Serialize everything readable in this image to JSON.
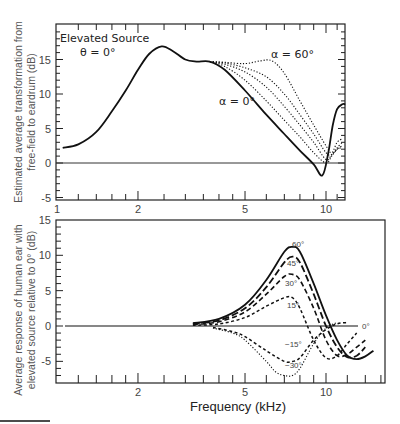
{
  "chart_data": [
    {
      "type": "line",
      "panel": "top",
      "title": "",
      "xlabel": "",
      "ylabel_line1": "Estimated average transformation from",
      "ylabel_line2": "free-field to eardrum (dB)",
      "xscale": "log",
      "xlim": [
        1,
        11.8
      ],
      "ylim": [
        -5,
        19
      ],
      "xticks": [
        {
          "value": 1,
          "label": "1"
        },
        {
          "value": 2,
          "label": "2"
        },
        {
          "value": 5,
          "label": "5"
        },
        {
          "value": 10,
          "label": "10"
        }
      ],
      "yticks": [
        {
          "value": 15,
          "label": "15"
        },
        {
          "value": 10,
          "label": "10"
        },
        {
          "value": 5,
          "label": "5"
        },
        {
          "value": 0,
          "label": "0"
        },
        {
          "value": -5,
          "label": "-5"
        }
      ],
      "annotations": {
        "title_line1": "Elevated Source",
        "title_line2": "θ = 0°",
        "alpha60": "α = 60°",
        "alpha0": "α = 0°"
      },
      "series": [
        {
          "name": "α = 0°",
          "style": "solid",
          "x": [
            1.05,
            1.2,
            1.4,
            1.6,
            1.8,
            2.0,
            2.2,
            2.45,
            2.7,
            3.0,
            3.3,
            3.7,
            4.2,
            5.0,
            6.0,
            7.0,
            8.0,
            9.0,
            9.7,
            10.2,
            10.6,
            11.0,
            11.5,
            11.8
          ],
          "y": [
            2.2,
            2.7,
            4.5,
            7.5,
            10.5,
            13.5,
            15.8,
            16.9,
            16.2,
            15.0,
            14.7,
            14.7,
            13.5,
            10.5,
            7.0,
            4.2,
            1.8,
            -0.2,
            -1.8,
            1.5,
            5.5,
            7.8,
            8.5,
            8.5
          ]
        },
        {
          "name": "α = 15°",
          "style": "dotted",
          "x": [
            3.7,
            4.2,
            5.0,
            6.0,
            7.0,
            8.0,
            9.0,
            10.0,
            10.5,
            11.0,
            11.5
          ],
          "y": [
            14.7,
            14.0,
            12.0,
            9.0,
            6.2,
            3.8,
            1.5,
            0.0,
            1.0,
            2.0,
            2.2
          ]
        },
        {
          "name": "α = 30°",
          "style": "dotted",
          "x": [
            3.7,
            4.2,
            5.0,
            6.0,
            7.0,
            8.0,
            9.0,
            10.0,
            10.5,
            11.0,
            11.5
          ],
          "y": [
            14.7,
            14.3,
            13.2,
            11.0,
            8.2,
            5.5,
            3.0,
            0.5,
            1.2,
            2.0,
            2.5
          ]
        },
        {
          "name": "α = 45°",
          "style": "dotted",
          "x": [
            3.7,
            4.2,
            5.0,
            6.0,
            7.0,
            8.0,
            9.0,
            10.0,
            10.5,
            11.0,
            11.5
          ],
          "y": [
            14.7,
            14.5,
            13.8,
            12.5,
            10.0,
            7.0,
            4.2,
            1.5,
            1.2,
            2.2,
            3.0
          ]
        },
        {
          "name": "α = 60°",
          "style": "dotted",
          "x": [
            3.7,
            4.2,
            5.0,
            5.7,
            6.3,
            7.0,
            8.0,
            9.0,
            10.0,
            10.5,
            11.0,
            11.5
          ],
          "y": [
            14.7,
            14.6,
            14.4,
            14.8,
            14.8,
            13.0,
            9.0,
            5.5,
            2.5,
            1.5,
            3.0,
            3.5
          ]
        }
      ],
      "reference_line": {
        "y": 0
      }
    },
    {
      "type": "line",
      "panel": "bottom",
      "title": "",
      "xlabel": "Frequency (kHz)",
      "ylabel_line1": "Average response of human ear with",
      "ylabel_line2": "elevated source relative to 0° (dB)",
      "xscale": "log",
      "xlim": [
        1.0,
        16.6
      ],
      "ylim": [
        -8,
        15
      ],
      "xticks": [
        {
          "value": 2,
          "label": "2"
        },
        {
          "value": 5,
          "label": "5"
        },
        {
          "value": 10,
          "label": "10"
        }
      ],
      "yticks": [
        {
          "value": 15,
          "label": "15"
        },
        {
          "value": 10,
          "label": "10"
        },
        {
          "value": 5,
          "label": "5"
        },
        {
          "value": 0,
          "label": "0"
        },
        {
          "value": -5,
          "label": "-5"
        }
      ],
      "series": [
        {
          "name": "60°",
          "label": "60°",
          "style": "solid",
          "x": [
            3.2,
            4.0,
            5.0,
            6.0,
            7.0,
            7.5,
            8.0,
            9.0,
            10.0,
            11.0,
            12.0,
            13.0,
            14.0,
            15.0
          ],
          "y": [
            0.4,
            1.0,
            3.0,
            6.5,
            10.5,
            11.2,
            10.5,
            6.0,
            1.5,
            -2.0,
            -4.2,
            -4.7,
            -4.3,
            -3.5
          ]
        },
        {
          "name": "45°",
          "label": "45°",
          "style": "long-dash",
          "x": [
            3.2,
            4.0,
            5.0,
            6.0,
            7.0,
            7.5,
            8.0,
            9.0,
            10.0,
            11.0,
            12.0,
            13.0,
            14.0
          ],
          "y": [
            0.3,
            0.8,
            2.5,
            5.5,
            9.0,
            9.8,
            9.0,
            4.5,
            0.0,
            -3.0,
            -4.4,
            -4.2,
            -3.0
          ]
        },
        {
          "name": "30°",
          "label": "30°",
          "style": "dash",
          "x": [
            3.2,
            4.0,
            5.0,
            6.0,
            7.0,
            7.5,
            8.0,
            9.0,
            10.0,
            11.0,
            12.0,
            13.0,
            14.0
          ],
          "y": [
            0.2,
            0.6,
            2.0,
            4.5,
            7.0,
            7.3,
            6.5,
            2.5,
            -2.0,
            -4.2,
            -4.0,
            -3.0,
            -2.0
          ]
        },
        {
          "name": "15°",
          "label": "15°",
          "style": "short-dash",
          "x": [
            3.2,
            4.0,
            5.0,
            6.0,
            7.0,
            7.5,
            8.0,
            9.0,
            10.0,
            11.0,
            12.0,
            13.0
          ],
          "y": [
            0.1,
            0.3,
            1.2,
            2.8,
            4.0,
            4.0,
            2.5,
            -2.0,
            -4.5,
            -4.2,
            -2.5,
            -1.0
          ]
        },
        {
          "name": "0°",
          "label": "0°",
          "style": "solid-thin",
          "x": [
            1.0,
            13.0
          ],
          "y": [
            0,
            0
          ]
        },
        {
          "name": "-15°",
          "label": "−15°",
          "style": "short-dash",
          "x": [
            3.8,
            4.5,
            5.0,
            6.0,
            7.0,
            7.5,
            8.0,
            9.0,
            10.0,
            11.0,
            12.0
          ],
          "y": [
            -0.2,
            -0.8,
            -1.5,
            -3.5,
            -5.0,
            -5.0,
            -4.5,
            -2.0,
            -0.5,
            0.3,
            0.5
          ]
        },
        {
          "name": "-30°",
          "label": "−30°",
          "style": "dotted",
          "x": [
            3.8,
            4.5,
            5.0,
            6.0,
            6.5,
            7.0,
            7.5,
            8.0,
            9.0,
            10.0,
            11.0
          ],
          "y": [
            -0.3,
            -1.0,
            -2.0,
            -5.0,
            -6.5,
            -7.0,
            -7.0,
            -6.0,
            -2.5,
            -0.3,
            0.5
          ]
        }
      ],
      "reference_line": {
        "y": 0
      }
    }
  ],
  "labels": {
    "top_title_1": "Elevated Source",
    "top_title_2": "θ = 0°",
    "top_alpha60": "α = 60°",
    "top_alpha0": "α = 0°",
    "top_ylabel_1": "Estimated average transformation from",
    "top_ylabel_2": "free-field to eardrum (dB)",
    "bottom_ylabel_1": "Average response of human ear with",
    "bottom_ylabel_2": "elevated source relative to 0° (dB)",
    "bottom_xlabel": "Frequency (kHz)"
  }
}
